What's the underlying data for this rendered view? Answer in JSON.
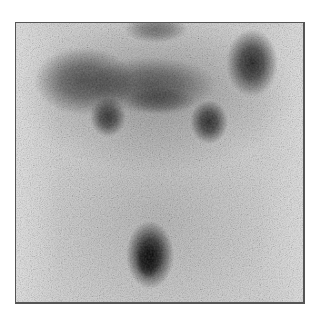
{
  "image": {
    "kind": "grayscale nuclear medicine scintigraphy scan",
    "frame": {
      "x": 15,
      "y": 22,
      "width": 289,
      "height": 281,
      "border_color": "#555555"
    },
    "background_tone": "#d2d2d2",
    "hotspots": [
      {
        "name": "upper-left-uptake",
        "cx": 68,
        "cy": 58,
        "rx": 46,
        "ry": 30,
        "intensity": 0.55
      },
      {
        "name": "upper-center-uptake",
        "cx": 130,
        "cy": 60,
        "rx": 60,
        "ry": 26,
        "intensity": 0.5
      },
      {
        "name": "upper-right-uptake",
        "cx": 236,
        "cy": 38,
        "rx": 22,
        "ry": 30,
        "intensity": 0.8
      },
      {
        "name": "top-center-uptake",
        "cx": 140,
        "cy": 5,
        "rx": 30,
        "ry": 12,
        "intensity": 0.45
      },
      {
        "name": "mid-left-uptake",
        "cx": 92,
        "cy": 93,
        "rx": 16,
        "ry": 18,
        "intensity": 0.7
      },
      {
        "name": "mid-right-uptake",
        "cx": 192,
        "cy": 98,
        "rx": 17,
        "ry": 20,
        "intensity": 0.75
      },
      {
        "name": "lower-center-uptake",
        "cx": 133,
        "cy": 232,
        "rx": 20,
        "ry": 30,
        "intensity": 0.95
      }
    ]
  }
}
